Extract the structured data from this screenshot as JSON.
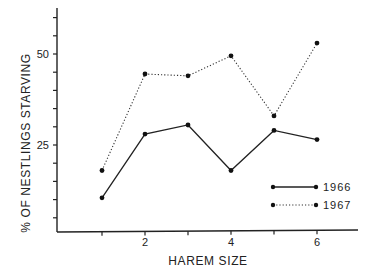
{
  "chart_data": {
    "type": "line",
    "title": "",
    "xlabel": "HAREM SIZE",
    "ylabel": "% OF NESTLINGS STARVING",
    "x": [
      1,
      2,
      3,
      4,
      5,
      6
    ],
    "xticks": [
      1,
      2,
      3,
      4,
      5,
      6
    ],
    "xtick_labels": [
      "",
      "2",
      "",
      "4",
      "",
      "6"
    ],
    "xlim": [
      0,
      7
    ],
    "yticks": [
      5,
      10,
      15,
      20,
      25,
      30,
      35,
      40,
      45,
      50,
      55,
      60
    ],
    "ytick_labels": {
      "25": "25",
      "50": "50"
    },
    "ylim": [
      0,
      63
    ],
    "grid": false,
    "legend_position": "lower right",
    "series": [
      {
        "name": "1966",
        "style": "solid",
        "color": "#222222",
        "values": [
          10.5,
          28,
          30.5,
          18,
          29,
          26.5
        ]
      },
      {
        "name": "1967",
        "style": "dotted",
        "color": "#333333",
        "values": [
          18,
          44.5,
          44,
          49.5,
          33,
          53
        ]
      }
    ]
  }
}
